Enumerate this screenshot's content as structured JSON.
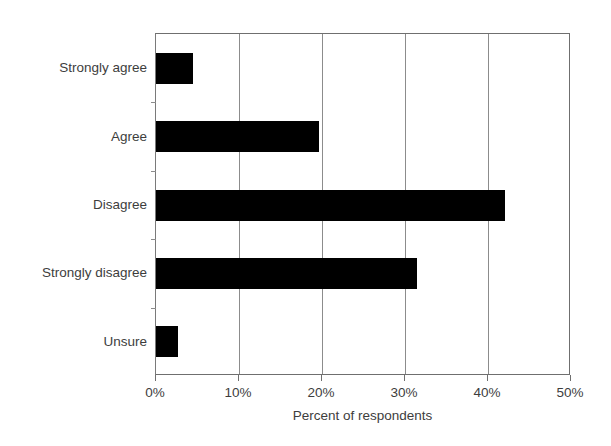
{
  "chart_data": {
    "type": "bar",
    "orientation": "horizontal",
    "title": "",
    "xlabel": "Percent of respondents",
    "ylabel": "",
    "categories": [
      "Strongly agree",
      "Agree",
      "Disagree",
      "Strongly disagree",
      "Unsure"
    ],
    "values": [
      4.4,
      19.6,
      42.0,
      31.5,
      2.7
    ],
    "xlim": [
      0,
      50
    ],
    "xticks": [
      0,
      10,
      20,
      30,
      40,
      50
    ],
    "xtick_labels": [
      "0%",
      "10%",
      "20%",
      "30%",
      "40%",
      "50%"
    ],
    "grid": "vertical",
    "legend": null,
    "bar_color": "#000000",
    "axis_color": "#6f6f6f",
    "gridline_color": "#8c8c8c",
    "text_color": "#3d3d3d",
    "background": "#ffffff"
  }
}
